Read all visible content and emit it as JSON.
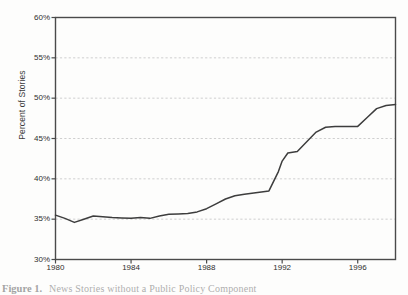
{
  "figure": {
    "caption_number": "Figure 1.",
    "caption_text": "News Stories without a Public Policy Component"
  },
  "colors": {
    "line": "#3d3d3d",
    "axis": "#4a4a4a",
    "grid": "#c9c9c9",
    "background": "#ffffff",
    "page": "#fdfdfc",
    "text": "#2e2e2e"
  },
  "chart_data": {
    "type": "line",
    "title": "",
    "xlabel": "",
    "ylabel": "Percent of Stories",
    "xlim": [
      1980,
      1998
    ],
    "ylim": [
      30,
      60
    ],
    "grid": true,
    "grid_axis": "y",
    "legend": false,
    "ytick_labels": [
      "60%",
      "55%",
      "50%",
      "45%",
      "40%",
      "35%",
      "30%"
    ],
    "ytick_values": [
      60,
      55,
      50,
      45,
      40,
      35,
      30
    ],
    "xtick_labels": [
      "1980",
      "1984",
      "1988",
      "1992",
      "1996"
    ],
    "xtick_values": [
      1980,
      1984,
      1988,
      1992,
      1996
    ],
    "series": [
      {
        "name": "Percent of news stories without a public policy component",
        "x": [
          1980.0,
          1980.5,
          1981.0,
          1981.5,
          1982.0,
          1982.5,
          1983.0,
          1983.5,
          1984.0,
          1984.5,
          1985.0,
          1985.5,
          1986.0,
          1986.5,
          1987.0,
          1987.5,
          1988.0,
          1988.5,
          1989.0,
          1989.5,
          1990.0,
          1990.5,
          1991.0,
          1991.3,
          1991.8,
          1992.0,
          1992.3,
          1992.8,
          1993.3,
          1993.8,
          1994.3,
          1994.8,
          1995.5,
          1996.0,
          1996.5,
          1997.0,
          1997.5,
          1998.0
        ],
        "values": [
          35.5,
          35.1,
          34.6,
          35.0,
          35.4,
          35.3,
          35.2,
          35.15,
          35.1,
          35.2,
          35.1,
          35.4,
          35.6,
          35.65,
          35.7,
          35.9,
          36.3,
          36.9,
          37.5,
          37.9,
          38.1,
          38.25,
          38.4,
          38.5,
          40.9,
          42.2,
          43.2,
          43.4,
          44.6,
          45.8,
          46.4,
          46.5,
          46.5,
          46.5,
          47.6,
          48.7,
          49.1,
          49.2
        ]
      }
    ],
    "annotations": []
  }
}
